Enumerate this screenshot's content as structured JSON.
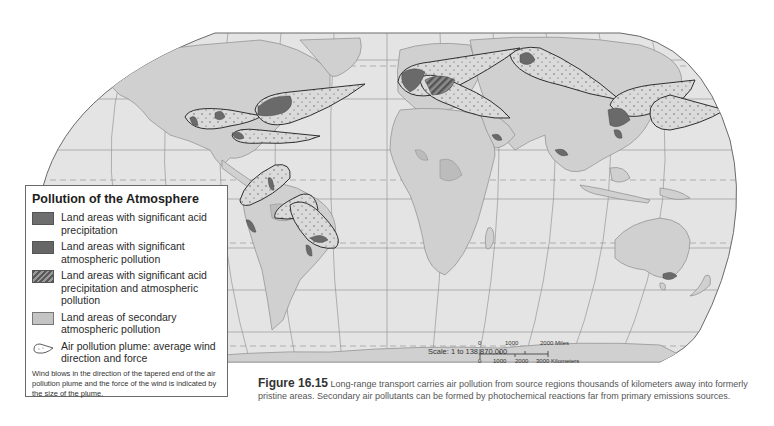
{
  "map": {
    "type": "world-map",
    "projection": "Robinson",
    "colors": {
      "ocean": "#e4e4e4",
      "land": "#d0d0d0",
      "secondary_pollution": "#bcbcbc",
      "significant_pollution": "#6a6a6a",
      "plume_fill": "#dadada",
      "plume_outline": "#2f2f2f",
      "graticule": "#8a8a8a",
      "border": "#8c8c8c"
    },
    "plumes": [
      {
        "region": "Western North America",
        "direction": "east"
      },
      {
        "region": "Eastern North America",
        "direction": "northeast over Atlantic"
      },
      {
        "region": "Gulf of Mexico / Southern US",
        "direction": "east"
      },
      {
        "region": "Northern South America",
        "direction": "northeast"
      },
      {
        "region": "Central South America",
        "direction": "northwest"
      },
      {
        "region": "Southeastern Brazil",
        "direction": "northwest"
      },
      {
        "region": "Western Europe",
        "direction": "east"
      },
      {
        "region": "Central Europe",
        "direction": "southeast"
      },
      {
        "region": "Russia / Urals",
        "direction": "east"
      },
      {
        "region": "Eastern China",
        "direction": "east over Pacific"
      },
      {
        "region": "Japan / Korea",
        "direction": "east over Pacific"
      }
    ]
  },
  "legend": {
    "title": "Pollution of the Atmosphere",
    "items": [
      {
        "icon": "acid-precipitation-swatch",
        "label": "Land areas with significant acid precipitation"
      },
      {
        "icon": "atmospheric-pollution-swatch",
        "label": "Land areas with significant atmospheric pollution"
      },
      {
        "icon": "hatched-swatch",
        "label": "Land areas with significant acid precipitation and atmospheric pollution"
      },
      {
        "icon": "secondary-pollution-swatch",
        "label": "Land areas of secondary atmospheric pollution"
      },
      {
        "icon": "plume-icon",
        "label": "Air pollution plume: average wind direction and force"
      }
    ],
    "note": "Wind blows in the direction of the tapered end of the air pollution plume and the force of the wind is indicated by the size of the plume."
  },
  "scale": {
    "label": "Scale:  1 to 138,870,000",
    "miles": [
      "0",
      "1000",
      "2000 Miles"
    ],
    "kilometers": [
      "0",
      "1000",
      "2000",
      "3000 Kilometers"
    ]
  },
  "caption": {
    "figure": "Figure 16.15",
    "text": " Long-range transport carries air pollution from source regions thousands of kilometers away into formerly pristine areas. Secondary air pollutants can be formed by photochemical reactions far from primary emissions sources."
  }
}
